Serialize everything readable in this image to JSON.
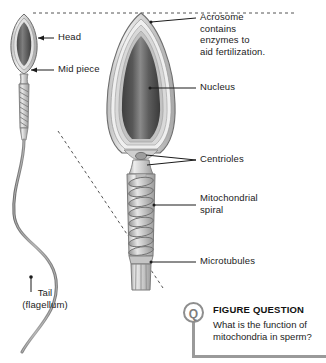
{
  "figure": {
    "background_color": "#ffffff",
    "ink_color": "#1b1b1b"
  },
  "overview_labels": [
    {
      "id": "head",
      "text": "Head"
    },
    {
      "id": "mid-piece",
      "text": "Mid piece"
    },
    {
      "id": "tail",
      "text": "Tail\n(flagellum)"
    }
  ],
  "detail_labels": [
    {
      "id": "acrosome",
      "text": "Acrosome\ncontains\nenzymes to\naid fertilization."
    },
    {
      "id": "nucleus",
      "text": "Nucleus"
    },
    {
      "id": "centrioles",
      "text": "Centrioles"
    },
    {
      "id": "mitochondrial-spiral",
      "text": "Mitochondrial\nspiral"
    },
    {
      "id": "microtubules",
      "text": "Microtubules"
    }
  ],
  "question": {
    "badge": "Q",
    "title": "FIGURE QUESTION",
    "text": "What is the function of mitochondria in sperm?",
    "rule_color": "#9a9a9a",
    "badge_color": "#8e8e8e"
  },
  "palette": {
    "nucleus_dark": "#4a4a4a",
    "nucleus_light": "#8d8d8d",
    "membrane_light": "#d8d8d8",
    "membrane_mid": "#b4b4b4",
    "outline": "#6e6e6e",
    "tail_gray": "#8a8a8a",
    "dashed_gray": "#555555"
  }
}
